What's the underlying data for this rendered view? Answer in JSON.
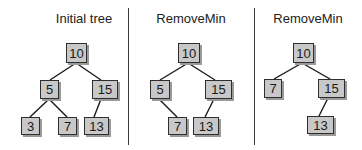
{
  "diagram": {
    "type": "binary-search-tree-sequence",
    "panels": [
      {
        "title": "Initial tree",
        "title_x": 84,
        "nodes": [
          {
            "id": "p1n10",
            "value": "10",
            "x": 66,
            "y": 43,
            "w": 21,
            "h": 20
          },
          {
            "id": "p1n5",
            "value": "5",
            "x": 40,
            "y": 80,
            "w": 19,
            "h": 19
          },
          {
            "id": "p1n15",
            "value": "15",
            "x": 92,
            "y": 80,
            "w": 26,
            "h": 19
          },
          {
            "id": "p1n3",
            "value": "3",
            "x": 21,
            "y": 117,
            "w": 19,
            "h": 18
          },
          {
            "id": "p1n7",
            "value": "7",
            "x": 58,
            "y": 117,
            "w": 19,
            "h": 18
          },
          {
            "id": "p1n13",
            "value": "13",
            "x": 84,
            "y": 117,
            "w": 25,
            "h": 18
          }
        ],
        "edges": [
          {
            "from": "10",
            "to": "5",
            "x1": 76,
            "y1": 63,
            "x2": 50,
            "y2": 80
          },
          {
            "from": "10",
            "to": "15",
            "x1": 76,
            "y1": 63,
            "x2": 101,
            "y2": 80
          },
          {
            "from": "5",
            "to": "3",
            "x1": 49,
            "y1": 99,
            "x2": 30,
            "y2": 117
          },
          {
            "from": "5",
            "to": "7",
            "x1": 49,
            "y1": 99,
            "x2": 67,
            "y2": 117
          },
          {
            "from": "15",
            "to": "13",
            "x1": 101,
            "y1": 99,
            "x2": 94,
            "y2": 117
          }
        ]
      },
      {
        "title": "RemoveMin",
        "title_x": 191,
        "nodes": [
          {
            "id": "p2n10",
            "value": "10",
            "x": 178,
            "y": 43,
            "w": 22,
            "h": 20
          },
          {
            "id": "p2n5",
            "value": "5",
            "x": 150,
            "y": 80,
            "w": 20,
            "h": 19
          },
          {
            "id": "p2n15",
            "value": "15",
            "x": 205,
            "y": 80,
            "w": 27,
            "h": 19
          },
          {
            "id": "p2n7",
            "value": "7",
            "x": 168,
            "y": 117,
            "w": 19,
            "h": 18
          },
          {
            "id": "p2n13",
            "value": "13",
            "x": 193,
            "y": 117,
            "w": 26,
            "h": 18
          }
        ],
        "edges": [
          {
            "from": "10",
            "to": "5",
            "x1": 188,
            "y1": 63,
            "x2": 160,
            "y2": 80
          },
          {
            "from": "10",
            "to": "15",
            "x1": 188,
            "y1": 63,
            "x2": 215,
            "y2": 80
          },
          {
            "from": "5",
            "to": "7",
            "x1": 159,
            "y1": 99,
            "x2": 177,
            "y2": 117
          },
          {
            "from": "15",
            "to": "13",
            "x1": 214,
            "y1": 99,
            "x2": 205,
            "y2": 117
          }
        ]
      },
      {
        "title": "RemoveMin",
        "title_x": 308,
        "nodes": [
          {
            "id": "p3n10",
            "value": "10",
            "x": 293,
            "y": 43,
            "w": 21,
            "h": 20
          },
          {
            "id": "p3n7",
            "value": "7",
            "x": 264,
            "y": 79,
            "w": 18,
            "h": 19
          },
          {
            "id": "p3n15",
            "value": "15",
            "x": 318,
            "y": 79,
            "w": 27,
            "h": 19
          },
          {
            "id": "p3n13",
            "value": "13",
            "x": 307,
            "y": 116,
            "w": 27,
            "h": 18
          }
        ],
        "edges": [
          {
            "from": "10",
            "to": "7",
            "x1": 302,
            "y1": 63,
            "x2": 274,
            "y2": 79
          },
          {
            "from": "10",
            "to": "15",
            "x1": 302,
            "y1": 63,
            "x2": 330,
            "y2": 79
          },
          {
            "from": "15",
            "to": "13",
            "x1": 328,
            "y1": 98,
            "x2": 319,
            "y2": 116
          }
        ]
      }
    ],
    "dividers": [
      {
        "x": 128
      },
      {
        "x": 254
      }
    ],
    "colors": {
      "node_fill": "#c8c8c8",
      "node_border": "#2e2e2e",
      "node_shadow": "#9a9a9a",
      "edge": "#1a1a1a",
      "divider": "#3a3a3a",
      "text": "#1a1a1a"
    }
  }
}
